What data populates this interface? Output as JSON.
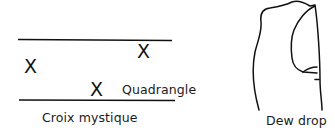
{
  "figures": [
    {
      "id": "croix-mystique",
      "caption": "Croix mystique",
      "marks": [
        "X",
        "X",
        "X"
      ],
      "annotation": "Quadrangle"
    },
    {
      "id": "dew-drop",
      "caption": "Dew drop"
    }
  ],
  "colors": {
    "ink": "#111111",
    "background": "#ffffff"
  }
}
